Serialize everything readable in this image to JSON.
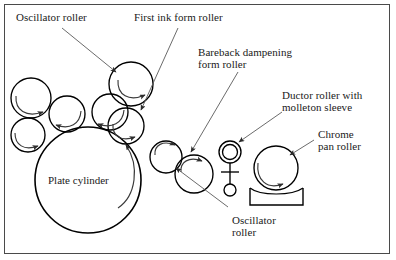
{
  "figure": {
    "kind": "printing-press-roller-train-diagram",
    "border_color": "#4a4a4a",
    "ink_color": "#000000",
    "background": "#ffffff"
  },
  "labels": {
    "oscillator_roller_top": "Oscillator roller",
    "first_ink_form_roller": "First ink form roller",
    "bareback_dampening_form_roller_line1": "Bareback dampening",
    "bareback_dampening_form_roller_line2": "form roller",
    "ductor_roller_line1": "Ductor roller with",
    "ductor_roller_line2": "molleton sleeve",
    "chrome_pan_roller_line1": "Chrome",
    "chrome_pan_roller_line2": "pan roller",
    "plate_cylinder": "Plate cylinder",
    "oscillator_roller_bottom_line1": "Oscillator",
    "oscillator_roller_bottom_line2": "roller"
  },
  "parts": [
    {
      "id": "plate-cylinder",
      "name": "Plate cylinder",
      "cx": 88,
      "cy": 180,
      "r": 53
    },
    {
      "id": "roller-upper-left",
      "name": "Oscillator roller (upper left)",
      "cx": 31,
      "cy": 98,
      "r": 20
    },
    {
      "id": "roller-lower-left",
      "name": "Roller (lower left)",
      "cx": 28,
      "cy": 135,
      "r": 17
    },
    {
      "id": "roller-mid-left",
      "name": "Roller (mid left)",
      "cx": 67,
      "cy": 114,
      "r": 18
    },
    {
      "id": "roller-mid",
      "name": "Roller (middle)",
      "cx": 110,
      "cy": 112,
      "r": 18
    },
    {
      "id": "roller-top",
      "name": "Oscillator roller (top)",
      "cx": 131,
      "cy": 84,
      "r": 22
    },
    {
      "id": "roller-first-ink-form",
      "name": "First ink form roller",
      "cx": 126,
      "cy": 126,
      "r": 18
    },
    {
      "id": "roller-oscillator-br",
      "name": "Oscillator roller (bottom right)",
      "cx": 166,
      "cy": 157,
      "r": 16
    },
    {
      "id": "roller-bareback",
      "name": "Bareback dampening form roller",
      "cx": 194,
      "cy": 174,
      "r": 19
    },
    {
      "id": "roller-ductor",
      "name": "Ductor roller with molleton sleeve",
      "cx": 230,
      "cy": 157,
      "r": 11
    },
    {
      "id": "roller-chrome-pan",
      "name": "Chrome pan roller",
      "cx": 276,
      "cy": 168,
      "r": 22
    }
  ],
  "ink_pan": {
    "name": "Ink pan",
    "left": 250,
    "top": 188,
    "width": 53,
    "height": 17
  },
  "callouts": [
    {
      "target": "roller-top",
      "label": "Oscillator roller",
      "from": [
        62,
        28
      ],
      "to": [
        116,
        72
      ]
    },
    {
      "target": "roller-first-ink-form",
      "label": "First ink form roller",
      "from": [
        176,
        28
      ],
      "to": [
        141,
        110
      ]
    },
    {
      "target": "roller-bareback",
      "label": "Bareback dampening form roller",
      "from": [
        238,
        72
      ],
      "to": [
        191,
        153
      ]
    },
    {
      "target": "roller-ductor",
      "label": "Ductor roller with molleton sleeve",
      "from": [
        282,
        112
      ],
      "to": [
        238,
        146
      ]
    },
    {
      "target": "roller-chrome-pan",
      "label": "Chrome pan roller",
      "from": [
        312,
        140
      ],
      "to": [
        288,
        155
      ]
    },
    {
      "target": "roller-oscillator-br",
      "label": "Oscillator roller",
      "from": [
        228,
        207
      ],
      "to": [
        175,
        167
      ]
    }
  ]
}
